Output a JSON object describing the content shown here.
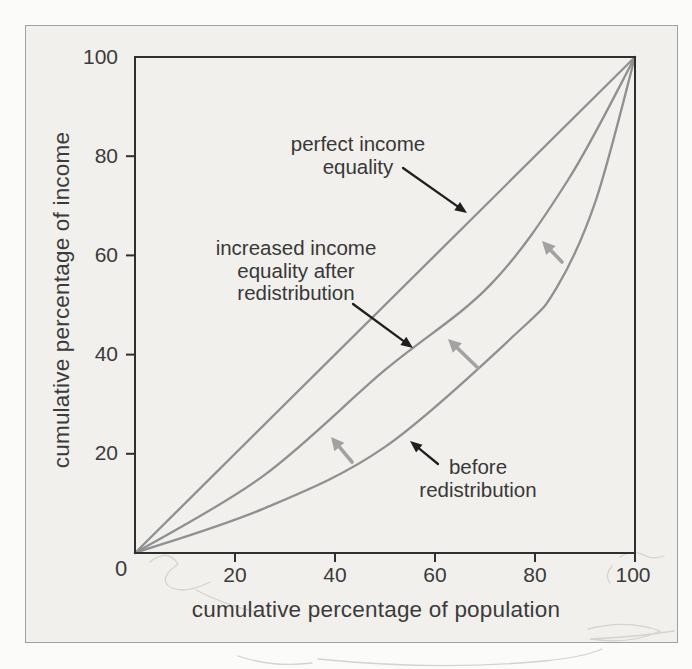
{
  "page": {
    "background": "#fbfbf9"
  },
  "frame": {
    "background": "#f2f0ec",
    "border_color": "#a3a19e"
  },
  "chart_data": {
    "type": "line",
    "title": "",
    "xlabel": "cumulative percentage of population",
    "ylabel": "cumulative percentage of income",
    "xlim": [
      0,
      100
    ],
    "ylim": [
      0,
      100
    ],
    "grid": false,
    "legend": "none (curves labeled by annotation arrows)",
    "x_ticks": [
      20,
      40,
      60,
      80,
      100
    ],
    "y_ticks": [
      20,
      40,
      60,
      80,
      100
    ],
    "origin_label": "0",
    "axis_color": "#2f2f2f",
    "curve_color": "#8f9091",
    "black_arrow_color": "#1f1f1f",
    "gray_arrow_color": "#a2a2a2",
    "series": [
      {
        "name": "perfect income equality",
        "points": [
          [
            0,
            0
          ],
          [
            100,
            100
          ]
        ]
      },
      {
        "name": "increased income equality after redistribution",
        "points": [
          [
            0,
            0
          ],
          [
            25.6,
            15.5
          ],
          [
            50,
            36.9
          ],
          [
            71,
            54
          ],
          [
            86.6,
            75.2
          ],
          [
            100,
            100
          ]
        ]
      },
      {
        "name": "before redistribution",
        "points": [
          [
            0,
            0
          ],
          [
            25.6,
            8.9
          ],
          [
            50,
            21.4
          ],
          [
            76.4,
            44.4
          ],
          [
            84.4,
            53.6
          ],
          [
            92.2,
            71.2
          ],
          [
            100,
            100
          ]
        ]
      }
    ],
    "labels": {
      "perfect": {
        "lines": [
          "perfect income",
          "equality"
        ]
      },
      "increased": {
        "lines": [
          "increased income",
          "equality after",
          "redistribution"
        ]
      },
      "before": {
        "lines": [
          "before",
          "redistribution"
        ]
      }
    },
    "black_arrows": [
      {
        "from": [
          403,
          168
        ],
        "to": [
          467,
          213
        ],
        "meaning": "points to perfect equality line"
      },
      {
        "from": [
          353,
          304
        ],
        "to": [
          413,
          348
        ],
        "meaning": "points to after-redistribution curve"
      },
      {
        "from": [
          438,
          464
        ],
        "to": [
          410,
          441
        ],
        "meaning": "points to before-redistribution curve"
      }
    ],
    "gray_arrows": [
      {
        "from": [
          352,
          462
        ],
        "to": [
          331,
          437
        ]
      },
      {
        "from": [
          478,
          368
        ],
        "to": [
          448,
          339
        ]
      },
      {
        "from": [
          562,
          262
        ],
        "to": [
          542,
          241
        ]
      }
    ]
  }
}
